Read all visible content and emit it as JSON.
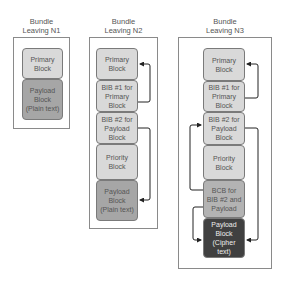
{
  "colors": {
    "light_block": "#d9d9d9",
    "mid_block": "#b3b3b3",
    "payload_plain": "#a6a6a6",
    "payload_cipher": "#404040",
    "arrow": "#222222"
  },
  "bundles": [
    {
      "title": "Bundle\nLeaving N1",
      "blocks": [
        {
          "label": "Primary\nBlock"
        },
        {
          "label": "Payload\nBlock\n(Plain text)"
        }
      ]
    },
    {
      "title": "Bundle\nLeaving N2",
      "blocks": [
        {
          "label": "Primary\nBlock"
        },
        {
          "label": "BIB #1 for\nPrimary Block"
        },
        {
          "label": "BIB #2 for\nPayload\nBlock"
        },
        {
          "label": "Priority\nBlock"
        },
        {
          "label": "Payload\nBlock\n(Plain text)"
        }
      ]
    },
    {
      "title": "Bundle\nLeaving N3",
      "blocks": [
        {
          "label": "Primary\nBlock"
        },
        {
          "label": "BIB #1 for\nPrimary Block"
        },
        {
          "label": "BIB #2 for\nPayload\nBlock"
        },
        {
          "label": "Priority\nBlock"
        },
        {
          "label": "BCB for\nBIB #2 and\nPayload"
        },
        {
          "label": "Payload\nBlock\n(Cipher text)"
        }
      ]
    }
  ]
}
